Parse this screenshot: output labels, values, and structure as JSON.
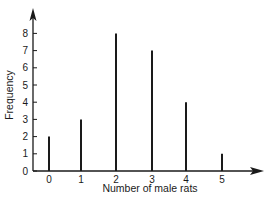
{
  "chart_data": {
    "type": "bar",
    "title": "",
    "xlabel": "Number of male rats",
    "ylabel": "Frequency",
    "categories": [
      "0",
      "1",
      "2",
      "3",
      "4",
      "5"
    ],
    "values": [
      2,
      3,
      8,
      7,
      4,
      1
    ],
    "yticks": [
      "0",
      "1",
      "2",
      "3",
      "4",
      "5",
      "6",
      "7",
      "8"
    ],
    "ylim": [
      0,
      9
    ],
    "grid": false,
    "legend": null,
    "style": "spike (vertical line) bars"
  }
}
